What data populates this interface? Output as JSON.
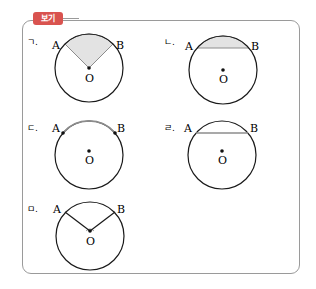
{
  "box": {
    "title": "보기",
    "accent": "#d9534f"
  },
  "items": [
    {
      "label": "ㄱ.",
      "a": "A",
      "b": "B",
      "o": "O",
      "desc": "shaded sector AOB"
    },
    {
      "label": "ㄴ.",
      "a": "A",
      "b": "B",
      "o": "O",
      "desc": "shaded circular segment cut by chord AB"
    },
    {
      "label": "ㄷ.",
      "a": "A",
      "b": "B",
      "o": "O",
      "desc": "highlighted minor arc AB"
    },
    {
      "label": "ㄹ.",
      "a": "A",
      "b": "B",
      "o": "O",
      "desc": "highlighted chord AB"
    },
    {
      "label": "ㅁ.",
      "a": "A",
      "b": "B",
      "o": "O",
      "desc": "central angle AOB"
    }
  ],
  "colors": {
    "shade": "#e3e3e3",
    "highlight": "#8c8c8c",
    "line": "#1a1a1a"
  }
}
